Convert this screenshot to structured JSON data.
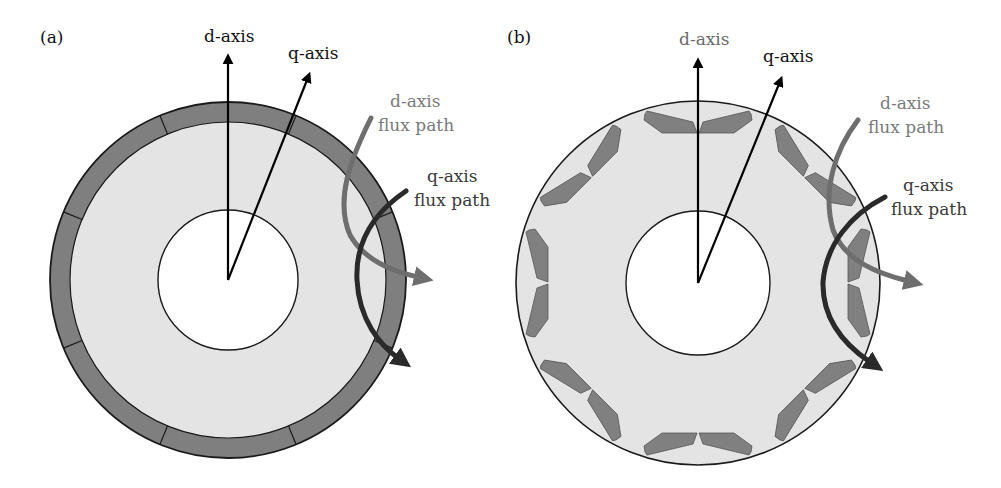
{
  "panels": {
    "a": {
      "label": "(a)",
      "d_axis_label": "d-axis",
      "q_axis_label": "q-axis",
      "d_flux_label_1": "d-axis",
      "d_flux_label_2": "flux path",
      "q_flux_label_1": "q-axis",
      "q_flux_label_2": "flux path",
      "description": "Surface-mounted permanent magnet rotor with 8 magnet segments"
    },
    "b": {
      "label": "(b)",
      "d_axis_label": "d-axis",
      "q_axis_label": "q-axis",
      "d_flux_label_1": "d-axis",
      "d_flux_label_2": "flux path",
      "q_flux_label_1": "q-axis",
      "q_flux_label_2": "flux path",
      "description": "Interior permanent magnet rotor with 8 V-shaped magnet pairs"
    }
  },
  "colors": {
    "core": "#e4e4e4",
    "magnet": "#808080",
    "outline": "#1a1a1a",
    "axis_arrow": "#000000",
    "d_flux": "#707070",
    "q_flux": "#2a2a2a",
    "d_flux_text": "#7a7a7a",
    "q_flux_text": "#3a3a3a"
  }
}
